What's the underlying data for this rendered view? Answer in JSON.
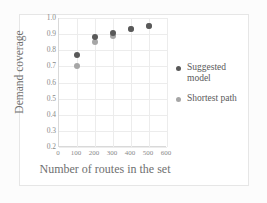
{
  "chart_data": {
    "type": "scatter",
    "title": "",
    "xlabel": "Number of routes in the set",
    "ylabel": "Demand coverage",
    "x": [
      100,
      200,
      300,
      400,
      500
    ],
    "xlim": [
      0,
      600
    ],
    "ylim": [
      0.2,
      1.0
    ],
    "xticks": [
      "0",
      "100",
      "200",
      "300",
      "400",
      "500",
      "600"
    ],
    "yticks": [
      "1.0",
      "0.9",
      "0.8",
      "0.7",
      "0.6",
      "0.5",
      "0.4",
      "0.3",
      "0.2"
    ],
    "grid": true,
    "legend_position": "right",
    "series": [
      {
        "name": "Suggested model",
        "color": "#595959",
        "values": [
          0.77,
          0.88,
          0.91,
          0.93,
          0.95
        ]
      },
      {
        "name": "Shortest path",
        "color": "#a6a6a6",
        "values": [
          0.7,
          0.85,
          0.89,
          0.93,
          0.95
        ]
      }
    ]
  },
  "legend": {
    "items": [
      {
        "label_line1": "Suggested",
        "label_line2": "model"
      },
      {
        "label_line1": "Shortest path",
        "label_line2": ""
      }
    ]
  },
  "colors": {
    "series_dark": "#595959",
    "series_light": "#a6a6a6",
    "grid": "#ececec",
    "axis": "#d9d9d9",
    "tick_text": "#8a8a8a",
    "title_text": "#6f6f6f"
  }
}
